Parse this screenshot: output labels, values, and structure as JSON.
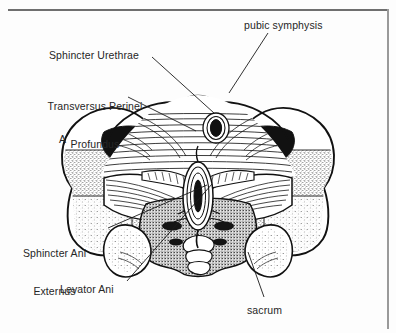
{
  "figure": {
    "panel_letter": "A",
    "labels": [
      {
        "name": "pubic-symphysis",
        "text": "pubic symphysis",
        "lines": [
          "pubic symphysis"
        ]
      },
      {
        "name": "sphincter-urethrae",
        "text": "Sphincter Urethrae",
        "lines": [
          "Sphincter Urethrae"
        ]
      },
      {
        "name": "transversus-perinei-profundus",
        "text": "Transversus Perinei Profundus",
        "lines": [
          "Transversus Perinei",
          "Profundus"
        ]
      },
      {
        "name": "sphincter-ani-externus",
        "text": "Sphincter Ani Externus",
        "lines": [
          "Sphincter Ani",
          "Externus"
        ]
      },
      {
        "name": "levator-ani",
        "text": "Levator Ani",
        "lines": [
          "Levator Ani"
        ]
      },
      {
        "name": "sacrum",
        "text": "sacrum",
        "lines": [
          "sacrum"
        ]
      }
    ],
    "label_text": {
      "pubic_symphysis": "pubic symphysis",
      "sphincter_urethrae": "Sphincter Urethrae",
      "transversus_perinei_line1": "Transversus Perinei",
      "transversus_perinei_line2": "Profundus",
      "sphincter_ani_line1": "Sphincter Ani",
      "sphincter_ani_line2": "Externus",
      "levator_ani": "Levator Ani",
      "sacrum": "sacrum"
    },
    "colors": {
      "ink": "#1a1a1a",
      "text": "#262626",
      "frame_top": "#6f6f6f",
      "frame_right": "#9a9a9a",
      "background": "#fdfdfd",
      "bone_fill": "#ffffff",
      "dense_black": "#111111"
    }
  }
}
